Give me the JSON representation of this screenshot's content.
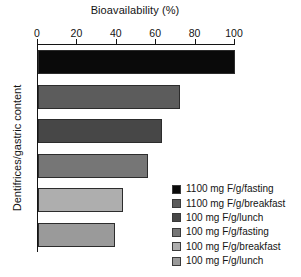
{
  "chart_data": {
    "type": "bar",
    "orientation": "horizontal",
    "title": "Bioavailability (%)",
    "xlabel": "Bioavailability (%)",
    "ylabel": "Dentifrices/gastric content",
    "xlim": [
      0,
      100
    ],
    "xticks": [
      0,
      20,
      40,
      60,
      80,
      100
    ],
    "xtick_labels": [
      "0",
      "20",
      "40",
      "60",
      "80",
      "100"
    ],
    "grid": false,
    "legend_position": "bottom-right",
    "categories": [
      "1100 mg F/g/fasting",
      "1100 mg F/g/breakfast",
      "100 mg F/g/lunch",
      "100 mg F/g/fasting",
      "100 mg F/g/breakfast",
      "100 mg F/g/lunch"
    ],
    "values": [
      100,
      72,
      63,
      56,
      43,
      39
    ],
    "colors": [
      "#0a0a0a",
      "#5c5c5c",
      "#474747",
      "#767676",
      "#aeaeae",
      "#9a9a9a"
    ]
  },
  "legend": {
    "items": [
      {
        "label": "1100 mg F/g/fasting",
        "color": "#0a0a0a"
      },
      {
        "label": "1100 mg F/g/breakfast",
        "color": "#5c5c5c"
      },
      {
        "label": "100 mg F/g/lunch",
        "color": "#474747"
      },
      {
        "label": "100 mg F/g/fasting",
        "color": "#767676"
      },
      {
        "label": "100 mg F/g/breakfast",
        "color": "#aeaeae"
      },
      {
        "label": "100 mg F/g/lunch",
        "color": "#9a9a9a"
      }
    ]
  }
}
